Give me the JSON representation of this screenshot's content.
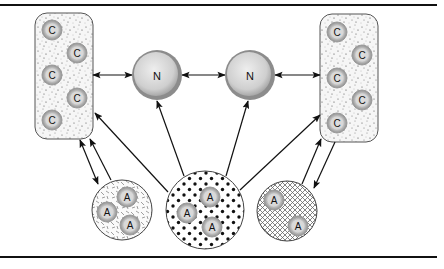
{
  "diagram": {
    "rules": {
      "top_y": 5,
      "bottom_y": 257,
      "x1": 0,
      "x2": 437
    },
    "colors": {
      "line": "#111111",
      "box_fill": "#f4f4f4",
      "node_rim": "#8a8a8a",
      "node_fill": "#d9d9d9",
      "small_rim": "#8f8f8f",
      "small_fill": "#c8c8c8"
    },
    "n_nodes": [
      {
        "label": "N",
        "cx": 157,
        "cy": 75,
        "r": 25
      },
      {
        "label": "N",
        "cx": 250,
        "cy": 75,
        "r": 25
      }
    ],
    "c_boxes": [
      {
        "name": "left-c-compartment",
        "x": 35,
        "y": 13,
        "w": 58,
        "h": 126,
        "items": [
          {
            "label": "C",
            "cx": 52,
            "cy": 30
          },
          {
            "label": "C",
            "cx": 77,
            "cy": 53
          },
          {
            "label": "C",
            "cx": 52,
            "cy": 75
          },
          {
            "label": "C",
            "cx": 77,
            "cy": 98
          },
          {
            "label": "C",
            "cx": 52,
            "cy": 120
          }
        ]
      },
      {
        "name": "right-c-compartment",
        "x": 320,
        "y": 14,
        "w": 58,
        "h": 128,
        "items": [
          {
            "label": "C",
            "cx": 337,
            "cy": 32
          },
          {
            "label": "C",
            "cx": 362,
            "cy": 55
          },
          {
            "label": "C",
            "cx": 337,
            "cy": 78
          },
          {
            "label": "C",
            "cx": 362,
            "cy": 100
          },
          {
            "label": "C",
            "cx": 337,
            "cy": 123
          }
        ]
      }
    ],
    "a_pools": [
      {
        "name": "left-a-pool",
        "pattern": "hatch-lines",
        "cx": 122,
        "cy": 210,
        "r": 30,
        "items": [
          {
            "label": "A",
            "cx": 127,
            "cy": 197
          },
          {
            "label": "A",
            "cx": 107,
            "cy": 212
          },
          {
            "label": "A",
            "cx": 130,
            "cy": 225
          }
        ]
      },
      {
        "name": "center-a-pool",
        "pattern": "dots",
        "cx": 205,
        "cy": 210,
        "r": 39,
        "items": [
          {
            "label": "A",
            "cx": 210,
            "cy": 197
          },
          {
            "label": "A",
            "cx": 187,
            "cy": 213
          },
          {
            "label": "A",
            "cx": 212,
            "cy": 227
          }
        ]
      },
      {
        "name": "right-a-pool",
        "pattern": "crosshatch",
        "cx": 287,
        "cy": 211,
        "r": 30,
        "items": [
          {
            "label": "A",
            "cx": 274,
            "cy": 200
          },
          {
            "label": "A",
            "cx": 298,
            "cy": 226
          }
        ]
      }
    ],
    "arrows": [
      {
        "name": "left-box-to-n1",
        "x1": 93,
        "y1": 75,
        "x2": 132,
        "y2": 75,
        "double": true
      },
      {
        "name": "n1-to-n2",
        "x1": 182,
        "y1": 75,
        "x2": 225,
        "y2": 75,
        "double": true
      },
      {
        "name": "n2-to-right-box",
        "x1": 275,
        "y1": 75,
        "x2": 320,
        "y2": 75,
        "double": true
      },
      {
        "name": "center-to-left-box",
        "x1": 168,
        "y1": 192,
        "x2": 95,
        "y2": 113,
        "double": false
      },
      {
        "name": "center-to-n1",
        "x1": 184,
        "y1": 176,
        "x2": 157,
        "y2": 101,
        "double": false
      },
      {
        "name": "center-to-n2",
        "x1": 226,
        "y1": 176,
        "x2": 248,
        "y2": 101,
        "double": false
      },
      {
        "name": "center-to-right-box",
        "x1": 240,
        "y1": 190,
        "x2": 320,
        "y2": 115,
        "double": false
      },
      {
        "name": "left-box-left-pool-exchange",
        "x1": 80,
        "y1": 140,
        "x2": 98,
        "y2": 184,
        "double": true
      },
      {
        "name": "left-pool-to-left-box",
        "x1": 111,
        "y1": 180,
        "x2": 90,
        "y2": 139,
        "double": false
      },
      {
        "name": "right-pool-to-right-box",
        "x1": 302,
        "y1": 184,
        "x2": 321,
        "y2": 139,
        "double": false
      },
      {
        "name": "right-box-to-right-pool",
        "x1": 335,
        "y1": 142,
        "x2": 314,
        "y2": 188,
        "double": false
      }
    ]
  }
}
